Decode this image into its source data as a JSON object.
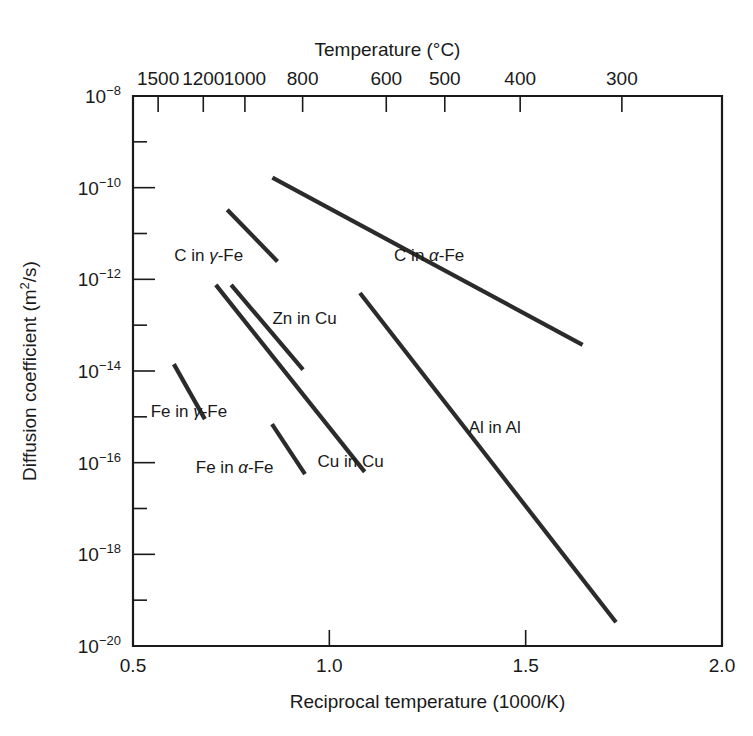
{
  "chart_data": {
    "type": "line",
    "title": "",
    "xlabel": "Reciprocal temperature (1000/K)",
    "ylabel": "Diffusion coefficient (m2/s)",
    "ylabel_display": "Diffusion coefficient (m",
    "ylabel_sup": "2",
    "ylabel_tail": "/s)",
    "top_axis_label": "Temperature (°C)",
    "xlim": [
      0.5,
      2.0
    ],
    "ylim_exponents": [
      -20,
      -8
    ],
    "yscale": "log",
    "grid": false,
    "legend": "inline-labels",
    "x_ticks": [
      "0.5",
      "1.0",
      "1.5",
      "2.0"
    ],
    "x_tick_values": [
      0.5,
      1.0,
      1.5,
      2.0
    ],
    "y_tick_exponents": [
      -8,
      -10,
      -12,
      -14,
      -16,
      -18,
      -20
    ],
    "y_tick_labels": [
      "10−8",
      "10−10",
      "10−12",
      "10−14",
      "10−16",
      "10−18",
      "10−20"
    ],
    "y_minor_exponents": [
      -9,
      -11,
      -13,
      -15,
      -17,
      -19
    ],
    "top_ticks": [
      {
        "label": "1500",
        "celsius": 1500,
        "x_value": 0.564
      },
      {
        "label": "1200",
        "celsius": 1200,
        "x_value": 0.679
      },
      {
        "label": "1000",
        "celsius": 1000,
        "x_value": 0.785
      },
      {
        "label": "800",
        "celsius": 800,
        "x_value": 0.932
      },
      {
        "label": "600",
        "celsius": 600,
        "x_value": 1.145
      },
      {
        "label": "500",
        "celsius": 500,
        "x_value": 1.294
      },
      {
        "label": "400",
        "celsius": 400,
        "x_value": 1.486
      },
      {
        "label": "300",
        "celsius": 300,
        "x_value": 1.745
      }
    ],
    "series": [
      {
        "name": "C in α-Fe",
        "label_prefix": "C in ",
        "label_greek": "α",
        "label_suffix": "-Fe",
        "label_x": 1.165,
        "label_y_exponent": -11.6,
        "points": [
          {
            "x": 0.855,
            "y_exponent": -9.78
          },
          {
            "x": 1.645,
            "y_exponent": -13.43
          }
        ]
      },
      {
        "name": "C in γ-Fe",
        "label_prefix": "C in ",
        "label_greek": "γ",
        "label_suffix": "-Fe",
        "label_x": 0.605,
        "label_y_exponent": -11.6,
        "points": [
          {
            "x": 0.74,
            "y_exponent": -10.48
          },
          {
            "x": 0.868,
            "y_exponent": -11.61
          }
        ]
      },
      {
        "name": "Zn in Cu",
        "label_prefix": "Zn in Cu",
        "label_greek": "",
        "label_suffix": "",
        "label_x": 0.855,
        "label_y_exponent": -12.98,
        "points": [
          {
            "x": 0.75,
            "y_exponent": -12.12
          },
          {
            "x": 0.933,
            "y_exponent": -13.97
          }
        ]
      },
      {
        "name": "Cu in Cu",
        "label_prefix": "Cu in Cu",
        "label_greek": "",
        "label_suffix": "",
        "label_x": 0.97,
        "label_y_exponent": -16.1,
        "points": [
          {
            "x": 0.711,
            "y_exponent": -12.12
          },
          {
            "x": 1.09,
            "y_exponent": -16.2
          }
        ]
      },
      {
        "name": "Fe in γ-Fe",
        "label_prefix": "Fe in ",
        "label_greek": "γ",
        "label_suffix": "-Fe",
        "label_x": 0.545,
        "label_y_exponent": -15.0,
        "points": [
          {
            "x": 0.604,
            "y_exponent": -13.85
          },
          {
            "x": 0.683,
            "y_exponent": -15.05
          }
        ]
      },
      {
        "name": "Fe in α-Fe",
        "label_prefix": "Fe in ",
        "label_greek": "α",
        "label_suffix": "-Fe",
        "label_x": 0.66,
        "label_y_exponent": -16.22,
        "points": [
          {
            "x": 0.854,
            "y_exponent": -15.16
          },
          {
            "x": 0.938,
            "y_exponent": -16.25
          }
        ]
      },
      {
        "name": "Al in Al",
        "label_prefix": "Al in Al",
        "label_greek": "",
        "label_suffix": "",
        "label_x": 1.355,
        "label_y_exponent": -15.35,
        "points": [
          {
            "x": 1.078,
            "y_exponent": -12.3
          },
          {
            "x": 1.73,
            "y_exponent": -19.48
          }
        ]
      }
    ]
  }
}
